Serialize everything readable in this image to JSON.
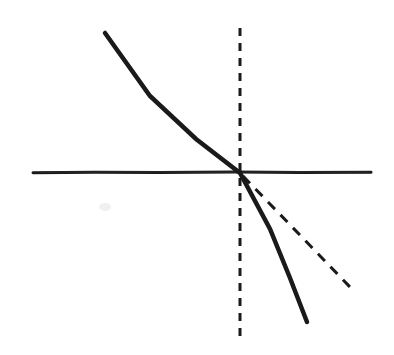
{
  "figure": {
    "width": 394,
    "height": 355,
    "background_color": "#ffffff",
    "ink_color": "#1a1a1a",
    "style": "hand-drawn sketch, pen on paper"
  },
  "chart_data": {
    "type": "line",
    "title": "",
    "subtitle": "",
    "xlabel": "",
    "ylabel": "",
    "grid": false,
    "legend": null,
    "annotations": [],
    "axes": {
      "horizontal_axis": {
        "name": "horizontal-axis",
        "style": "solid",
        "color": "#1a1a1a",
        "stroke_width": 3,
        "x1": 33,
        "y1": 172,
        "x2": 371,
        "y2": 172
      },
      "vertical_axis": {
        "name": "vertical-axis",
        "style": "dashed",
        "color": "#1a1a1a",
        "stroke_width": 3,
        "dash_length": 8,
        "gap_length": 7,
        "x1": 240,
        "y1": 28,
        "x2": 240,
        "y2": 341
      }
    },
    "origin": {
      "x": 240,
      "y": 173
    },
    "series": [
      {
        "name": "steep-line",
        "style": "solid",
        "color": "#1a1a1a",
        "stroke_width": 4.5,
        "x1": 105,
        "y1": 33,
        "x2": 307,
        "y2": 322,
        "note": "thick solid line descending left-to-right through the origin; shallower above the axis, steeper below"
      },
      {
        "name": "flat-dashed-line",
        "style": "dashed",
        "color": "#1a1a1a",
        "stroke_width": 3,
        "dash_length": 10,
        "gap_length": 8,
        "x1": 243,
        "y1": 176,
        "x2": 350,
        "y2": 287,
        "note": "dashed line descending from the origin into the lower right quadrant, flatter than the solid line"
      }
    ],
    "marks": [
      {
        "name": "paper-smudge",
        "x": 105,
        "y": 207,
        "radius": 5,
        "color": "#f0f0f0"
      }
    ]
  }
}
